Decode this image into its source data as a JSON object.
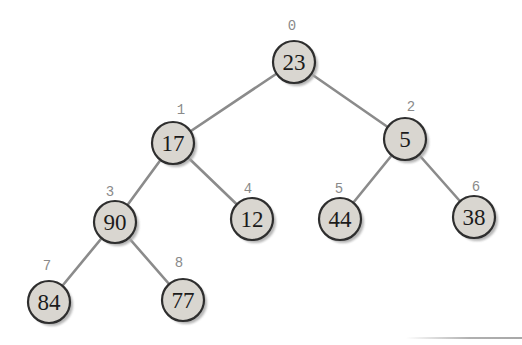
{
  "diagram": {
    "type": "binary-tree",
    "node_radius": 21,
    "shadow_offset": 3,
    "colors": {
      "background": "#ffffff",
      "node_fill": "#d9d6d0",
      "node_border": "#2e2e2e",
      "node_text": "#1b1b1b",
      "index_text": "#8a8a8a",
      "edge": "#8b8b8b",
      "shadow": "#a9a9a9"
    },
    "nodes": [
      {
        "index": "0",
        "value": "23",
        "x": 294,
        "y": 62,
        "lx": 292,
        "ly": 30
      },
      {
        "index": "1",
        "value": "17",
        "x": 173,
        "y": 143,
        "lx": 181,
        "ly": 114
      },
      {
        "index": "2",
        "value": "5",
        "x": 405,
        "y": 139,
        "lx": 411,
        "ly": 111
      },
      {
        "index": "3",
        "value": "90",
        "x": 115,
        "y": 222,
        "lx": 110,
        "ly": 196
      },
      {
        "index": "4",
        "value": "12",
        "x": 252,
        "y": 219,
        "lx": 248,
        "ly": 193
      },
      {
        "index": "5",
        "value": "44",
        "x": 340,
        "y": 219,
        "lx": 339,
        "ly": 193
      },
      {
        "index": "6",
        "value": "38",
        "x": 474,
        "y": 217,
        "lx": 476,
        "ly": 191
      },
      {
        "index": "7",
        "value": "84",
        "x": 49,
        "y": 302,
        "lx": 47,
        "ly": 270
      },
      {
        "index": "8",
        "value": "77",
        "x": 183,
        "y": 300,
        "lx": 179,
        "ly": 267
      }
    ],
    "edges": [
      [
        0,
        1
      ],
      [
        0,
        2
      ],
      [
        1,
        3
      ],
      [
        1,
        4
      ],
      [
        2,
        5
      ],
      [
        2,
        6
      ],
      [
        3,
        7
      ],
      [
        3,
        8
      ]
    ]
  }
}
